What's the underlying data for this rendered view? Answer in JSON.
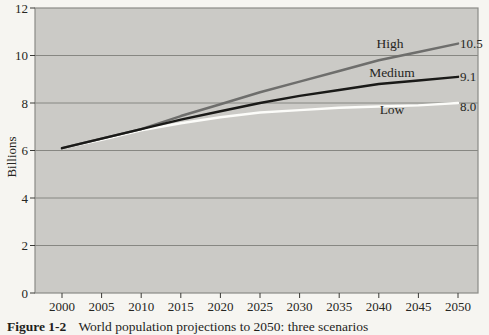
{
  "figure": {
    "caption_label": "Figure 1-2",
    "caption_text": "World population projections to 2050: three scenarios"
  },
  "chart_data": {
    "type": "line",
    "title": "",
    "xlabel": "",
    "ylabel": "Billions",
    "x": [
      2000,
      2005,
      2010,
      2015,
      2020,
      2025,
      2030,
      2035,
      2040,
      2045,
      2050
    ],
    "x_tick_labels": [
      "2000",
      "2005",
      "2010",
      "2015",
      "2020",
      "2025",
      "2030",
      "2035",
      "2040",
      "2045",
      "2050"
    ],
    "y_ticks": [
      0,
      2,
      4,
      6,
      8,
      10,
      12
    ],
    "y_tick_labels": [
      "0",
      "2",
      "4",
      "6",
      "8",
      "10",
      "12"
    ],
    "gridlines_at": [
      2,
      4,
      6,
      8,
      10
    ],
    "ylim": [
      0,
      12
    ],
    "xlim": [
      2000,
      2050
    ],
    "grid": "horizontal",
    "legend_position": "inline-labels-right",
    "colors": {
      "page_bg": "#f6f5f1",
      "plot_bg": "#cbcac6",
      "plot_border": "#8b8b87",
      "gridline": "#7f7f7b",
      "tick": "#3a3a36",
      "text": "#262622"
    },
    "series": [
      {
        "name": "High",
        "color": "#6e6e6c",
        "z": 1,
        "values": [
          6.1,
          6.5,
          6.9,
          7.45,
          7.95,
          8.45,
          8.9,
          9.35,
          9.8,
          10.15,
          10.5
        ],
        "end_label": "10.5",
        "name_label_pos": {
          "x": 390,
          "y": 48
        },
        "end_label_pos": {
          "x": 460,
          "y": 48
        }
      },
      {
        "name": "Medium",
        "color": "#1a1a18",
        "z": 2,
        "values": [
          6.1,
          6.5,
          6.9,
          7.3,
          7.65,
          8.0,
          8.3,
          8.55,
          8.8,
          8.95,
          9.1
        ],
        "end_label": "9.1",
        "name_label_pos": {
          "x": 392,
          "y": 77
        },
        "end_label_pos": {
          "x": 460,
          "y": 81
        }
      },
      {
        "name": "Low",
        "color": "#fcfcf9",
        "z": 0,
        "values": [
          6.1,
          6.45,
          6.85,
          7.15,
          7.4,
          7.6,
          7.7,
          7.8,
          7.85,
          7.9,
          8.0
        ],
        "end_label": "8.0",
        "name_label_pos": {
          "x": 392,
          "y": 114
        },
        "end_label_pos": {
          "x": 460,
          "y": 111
        }
      }
    ]
  }
}
